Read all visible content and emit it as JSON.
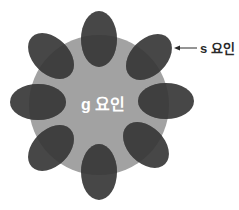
{
  "diagram": {
    "title": "",
    "center_label": "g 요인",
    "satellite_label": "s 요인",
    "colors": {
      "background": "#ffffff",
      "circle": "#a3a3a3",
      "ellipse": "#474747",
      "center_text": "#ffffff",
      "label_text": "#2a2a2a"
    },
    "nodes": [
      {
        "id": "g",
        "label": "g 요인",
        "type": "central-circle"
      },
      {
        "id": "s1",
        "type": "satellite-ellipse",
        "position": "top"
      },
      {
        "id": "s2",
        "type": "satellite-ellipse",
        "position": "top-right"
      },
      {
        "id": "s3",
        "type": "satellite-ellipse",
        "position": "right"
      },
      {
        "id": "s4",
        "type": "satellite-ellipse",
        "position": "bottom-right"
      },
      {
        "id": "s5",
        "type": "satellite-ellipse",
        "position": "bottom"
      },
      {
        "id": "s6",
        "type": "satellite-ellipse",
        "position": "bottom-left"
      },
      {
        "id": "s7",
        "type": "satellite-ellipse",
        "position": "left"
      },
      {
        "id": "s8",
        "type": "satellite-ellipse",
        "position": "top-left"
      }
    ],
    "annotations": [
      {
        "text": "s 요인",
        "points_to": "s2",
        "type": "arrow"
      }
    ]
  }
}
